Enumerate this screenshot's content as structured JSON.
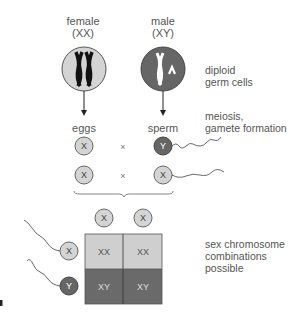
{
  "parents": {
    "female": {
      "label": "female",
      "genotype": "(XX)"
    },
    "male": {
      "label": "male",
      "genotype": "(XY)"
    }
  },
  "gametes": {
    "female": "eggs",
    "male": "sperm"
  },
  "side_labels": {
    "germ_cells": [
      "diploid",
      "germ cells"
    ],
    "meiosis": [
      "meiosis,",
      "gamete formation"
    ],
    "combinations": [
      "sex chromosome",
      "combinations",
      "possible"
    ]
  },
  "crosses": [
    {
      "egg": "X",
      "op": "×",
      "sperm": "Y"
    },
    {
      "egg": "X",
      "op": "×",
      "sperm": "X"
    }
  ],
  "punnett": {
    "columns": [
      "X",
      "X"
    ],
    "rows": [
      "X",
      "Y"
    ],
    "cells": [
      [
        "XX",
        "XX"
      ],
      [
        "XY",
        "XY"
      ]
    ]
  },
  "panel_label": "a",
  "colors": {
    "light_cell": "#cfcfcf",
    "dark_cell": "#6a6a6a",
    "text": "#555555"
  }
}
